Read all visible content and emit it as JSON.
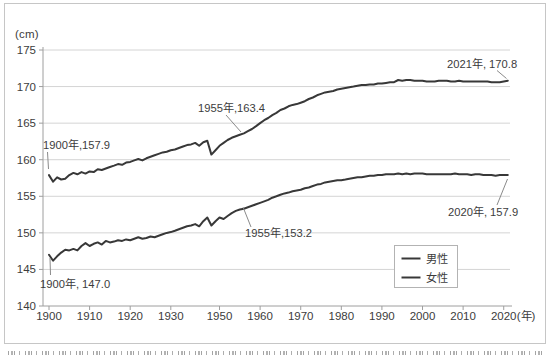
{
  "chart_data": {
    "type": "line",
    "title": "",
    "unit_label": "(cm)",
    "x_unit_label": "(年)",
    "ylim": [
      140,
      175
    ],
    "yticks": [
      140,
      145,
      150,
      155,
      160,
      165,
      170,
      175
    ],
    "xticks": [
      1900,
      1910,
      1920,
      1930,
      1950,
      1960,
      1970,
      1980,
      1990,
      2000,
      2010,
      2020
    ],
    "axis_note": "x-axis is categorical by survey year; war years 1940-1947 are omitted (no 1940 tick)",
    "grid": "horizontal-only",
    "legend": {
      "position": "inside-lower-right",
      "entries": [
        "男性",
        "女性"
      ]
    },
    "line_color": "#383838",
    "grid_color": "#d4d4d4",
    "axis_color": "#9e9e9e",
    "text_color": "#3c3c3c",
    "leader_color": "#8a8a8a",
    "years": [
      1900,
      1901,
      1902,
      1903,
      1904,
      1905,
      1906,
      1907,
      1908,
      1909,
      1910,
      1911,
      1912,
      1913,
      1914,
      1915,
      1916,
      1917,
      1918,
      1919,
      1920,
      1921,
      1922,
      1923,
      1924,
      1925,
      1926,
      1927,
      1928,
      1929,
      1930,
      1931,
      1932,
      1933,
      1934,
      1935,
      1936,
      1937,
      1938,
      1939,
      1948,
      1949,
      1950,
      1951,
      1952,
      1953,
      1954,
      1955,
      1956,
      1957,
      1958,
      1959,
      1960,
      1961,
      1962,
      1963,
      1964,
      1965,
      1966,
      1967,
      1968,
      1969,
      1970,
      1971,
      1972,
      1973,
      1974,
      1975,
      1976,
      1977,
      1978,
      1979,
      1980,
      1981,
      1982,
      1983,
      1984,
      1985,
      1986,
      1987,
      1988,
      1989,
      1990,
      1991,
      1992,
      1993,
      1994,
      1995,
      1996,
      1997,
      1998,
      1999,
      2000,
      2001,
      2002,
      2003,
      2004,
      2005,
      2006,
      2007,
      2008,
      2009,
      2010,
      2011,
      2012,
      2013,
      2014,
      2015,
      2016,
      2017,
      2018,
      2019,
      2020,
      2021
    ],
    "series": [
      {
        "id": "male",
        "name": "男性",
        "values": [
          157.9,
          157.0,
          157.6,
          157.3,
          157.4,
          157.9,
          158.2,
          158.0,
          158.3,
          158.1,
          158.4,
          158.3,
          158.7,
          158.6,
          158.8,
          159.0,
          159.2,
          159.4,
          159.3,
          159.6,
          159.7,
          159.9,
          160.1,
          159.9,
          160.2,
          160.4,
          160.6,
          160.8,
          161.0,
          161.1,
          161.3,
          161.4,
          161.6,
          161.8,
          162.0,
          162.1,
          162.3,
          161.9,
          162.4,
          162.6,
          160.7,
          161.3,
          161.9,
          162.3,
          162.7,
          163.0,
          163.2,
          163.4,
          163.6,
          163.9,
          164.2,
          164.6,
          165.0,
          165.4,
          165.7,
          166.1,
          166.4,
          166.8,
          167.0,
          167.3,
          167.5,
          167.6,
          167.8,
          168.0,
          168.3,
          168.5,
          168.8,
          169.0,
          169.2,
          169.3,
          169.4,
          169.6,
          169.7,
          169.8,
          169.9,
          170.0,
          170.1,
          170.2,
          170.2,
          170.3,
          170.3,
          170.4,
          170.4,
          170.5,
          170.6,
          170.6,
          170.9,
          170.8,
          170.9,
          170.9,
          170.8,
          170.8,
          170.8,
          170.7,
          170.7,
          170.7,
          170.8,
          170.8,
          170.8,
          170.7,
          170.7,
          170.8,
          170.7,
          170.7,
          170.7,
          170.7,
          170.7,
          170.7,
          170.7,
          170.6,
          170.6,
          170.6,
          170.7,
          170.8
        ]
      },
      {
        "id": "female",
        "name": "女性",
        "values": [
          147.0,
          146.2,
          146.8,
          147.3,
          147.7,
          147.6,
          147.8,
          147.6,
          148.2,
          148.6,
          148.2,
          148.5,
          148.7,
          148.4,
          148.9,
          148.7,
          148.8,
          149.0,
          148.9,
          149.1,
          149.0,
          149.2,
          149.4,
          149.2,
          149.3,
          149.5,
          149.4,
          149.6,
          149.8,
          150.0,
          150.1,
          150.3,
          150.5,
          150.7,
          150.9,
          151.0,
          151.2,
          150.9,
          151.6,
          152.1,
          151.0,
          151.6,
          152.1,
          151.9,
          152.3,
          152.7,
          153.0,
          153.2,
          153.3,
          153.5,
          153.7,
          153.9,
          154.1,
          154.3,
          154.5,
          154.8,
          155.0,
          155.2,
          155.4,
          155.5,
          155.7,
          155.8,
          155.9,
          156.1,
          156.2,
          156.4,
          156.6,
          156.7,
          156.9,
          157.0,
          157.1,
          157.2,
          157.2,
          157.3,
          157.4,
          157.5,
          157.6,
          157.6,
          157.7,
          157.8,
          157.8,
          157.9,
          157.9,
          158.0,
          158.0,
          158.0,
          158.1,
          158.0,
          158.1,
          158.0,
          158.1,
          158.1,
          158.1,
          158.0,
          158.0,
          158.0,
          158.0,
          158.0,
          158.0,
          158.0,
          158.1,
          158.0,
          158.0,
          158.0,
          157.9,
          158.0,
          158.0,
          157.9,
          157.9,
          157.9,
          157.8,
          157.9,
          157.9,
          157.9
        ]
      }
    ],
    "annotations": [
      {
        "text": "1900年,157.9",
        "series": "男性",
        "year": 1900,
        "value": 157.9
      },
      {
        "text": "1955年,163.4",
        "series": "男性",
        "year": 1955,
        "value": 163.4
      },
      {
        "text": "2021年, 170.8",
        "series": "男性",
        "year": 2021,
        "value": 170.8
      },
      {
        "text": "1900年, 147.0",
        "series": "女性",
        "year": 1900,
        "value": 147.0
      },
      {
        "text": "1955年,153.2",
        "series": "女性",
        "year": 1955,
        "value": 153.2
      },
      {
        "text": "2020年, 157.9",
        "series": "女性",
        "year": 2020,
        "value": 157.9
      }
    ]
  }
}
